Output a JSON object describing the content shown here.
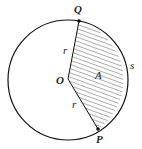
{
  "diagram": {
    "labels": {
      "Q": "Q",
      "P": "P",
      "O": "O",
      "A": "A",
      "s": "s",
      "r_top": "r",
      "r_bottom": "r"
    },
    "colors": {
      "stroke": "#111111",
      "hatch": "#333333",
      "background": "#ffffff"
    }
  }
}
